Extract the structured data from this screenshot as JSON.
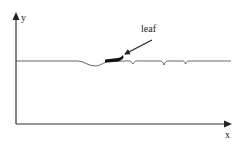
{
  "diagram": {
    "type": "schematic",
    "axes": {
      "x_label": "x",
      "y_label": "y"
    },
    "annotations": {
      "leaf_label": "leaf"
    },
    "colors": {
      "line": "#555555",
      "leaf": "#111111",
      "axis": "#333333"
    }
  }
}
